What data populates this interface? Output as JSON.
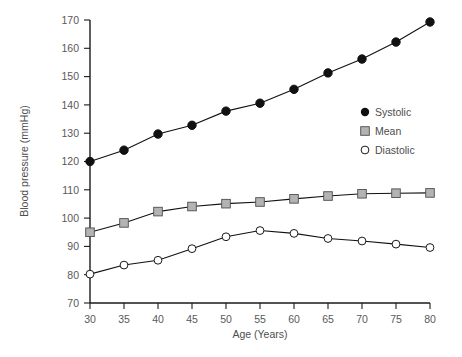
{
  "chart_data": {
    "type": "line",
    "title": "",
    "xlabel": "Age (Years)",
    "ylabel": "Blood pressure (mmHg)",
    "x": [
      30,
      35,
      40,
      45,
      50,
      55,
      60,
      65,
      70,
      75,
      80
    ],
    "xtick_labels": [
      "30",
      "35",
      "40",
      "45",
      "50",
      "55",
      "60",
      "65",
      "70",
      "75",
      "80"
    ],
    "ytick_labels": [
      "70",
      "80",
      "90",
      "100",
      "110",
      "120",
      "130",
      "140",
      "150",
      "160",
      "170"
    ],
    "yticks": [
      70,
      80,
      90,
      100,
      110,
      120,
      130,
      140,
      150,
      160,
      170
    ],
    "xlim": [
      28,
      82
    ],
    "ylim": [
      70,
      170
    ],
    "grid": false,
    "legend_position": "center-right",
    "series": [
      {
        "name": "Systolic",
        "marker": "filled-circle",
        "marker_color": "#111111",
        "line_color": "#111111",
        "values": [
          120,
          124,
          129.7,
          132.8,
          137.8,
          140.6,
          145.5,
          151.3,
          156.2,
          162.2,
          169.3
        ]
      },
      {
        "name": "Mean",
        "marker": "filled-square",
        "marker_color": "#b3b3b3",
        "line_color": "#111111",
        "values": [
          95,
          98.3,
          102.3,
          104.1,
          105.1,
          105.7,
          106.8,
          107.8,
          108.6,
          108.8,
          108.9
        ]
      },
      {
        "name": "Diastolic",
        "marker": "open-circle",
        "marker_color": "#ffffff",
        "line_color": "#111111",
        "values": [
          80.2,
          83.4,
          85.1,
          89.2,
          93.4,
          95.6,
          94.6,
          92.8,
          91.9,
          90.8,
          89.6
        ]
      }
    ]
  },
  "legend": {
    "entries": [
      {
        "label": "Systolic",
        "marker": "filled-circle"
      },
      {
        "label": "Mean",
        "marker": "filled-square"
      },
      {
        "label": "Diastolic",
        "marker": "open-circle"
      }
    ]
  },
  "colors": {
    "axis": "#1a1a1a",
    "text": "#4d4d4d",
    "systolic": "#111111",
    "mean": "#b3b3b3",
    "diastolic_fill": "#ffffff",
    "background": "#ffffff"
  }
}
